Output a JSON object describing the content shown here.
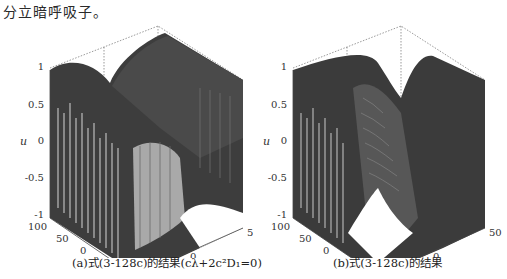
{
  "text": {
    "paragraph_fragment": "分立暗呼吸子。"
  },
  "figures": [
    {
      "id": "a",
      "caption": "(a)式(3-128c)的结果(cλ+2c²D₁=0)",
      "z_label": "u",
      "y_label": "t",
      "x_label": "site",
      "z_ticks": [
        "1",
        "0.5",
        "0",
        "-0.5",
        "-1"
      ],
      "t_ticks": [
        "100",
        "50",
        "0",
        "-50",
        "-100"
      ],
      "site_ticks": [
        "-50",
        "0",
        "50"
      ]
    },
    {
      "id": "b",
      "caption": "(b)式(3-128c)的结果",
      "z_label": "u",
      "y_label": "t",
      "x_label": "site",
      "z_ticks": [
        "1",
        "0.5",
        "0",
        "-0.5",
        "-1"
      ],
      "t_ticks": [
        "100",
        "50",
        "0",
        "-50",
        "-100"
      ],
      "site_ticks": [
        "-50",
        "0",
        "50"
      ]
    }
  ]
}
